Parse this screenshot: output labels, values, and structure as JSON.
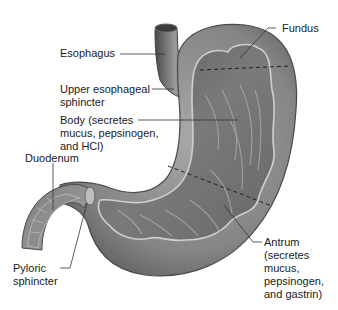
{
  "diagram": {
    "labels": {
      "fundus": "Fundus",
      "esophagus": "Esophagus",
      "upper_sphincter": "Upper esophageal\nsphincter",
      "body": "Body (secretes\nmucus, pepsinogen,\nand HCl)",
      "duodenum": "Duodenum",
      "pyloric": "Pyloric\nsphincter",
      "antrum": "Antrum\n(secretes\nmucus,\npepsinogen,\nand gastrin)"
    },
    "colors": {
      "outer_wall": "#8a8a8a",
      "outer_wall_dark": "#5a5a5a",
      "inner_mucosa": "#6e6e6e",
      "mucosa_highlight": "#c8c8c8",
      "leader_line": "#333333",
      "text": "#1a1a1a"
    }
  }
}
